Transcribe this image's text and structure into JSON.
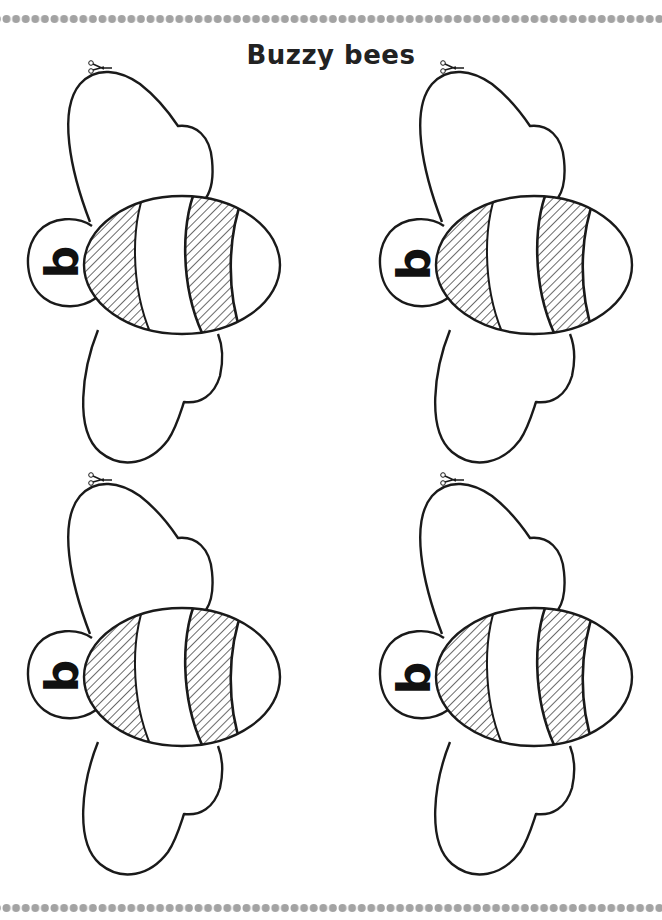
{
  "worksheet": {
    "title": "Buzzy bees",
    "colors": {
      "line": "#1a1a1a",
      "dot_border": "#9a9a9a",
      "background": "#ffffff",
      "title": "#222222"
    },
    "border": {
      "top": "dotted-bead-row",
      "bottom": "dotted-bead-row"
    },
    "bees": [
      {
        "position": "top-left",
        "letter": "b",
        "cut_icon": "scissors-icon"
      },
      {
        "position": "top-right",
        "letter": "b",
        "cut_icon": "scissors-icon"
      },
      {
        "position": "bottom-left",
        "letter": "b",
        "cut_icon": "scissors-icon"
      },
      {
        "position": "bottom-right",
        "letter": "b",
        "cut_icon": "scissors-icon"
      }
    ]
  }
}
